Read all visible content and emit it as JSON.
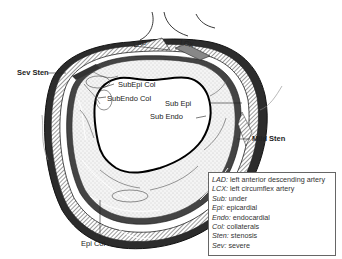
{
  "diagram": {
    "labels": {
      "lad": "LAD",
      "lcx": "LCX",
      "sev_sten": "Sev Sten",
      "subepi_col": "SubEpi Col",
      "subendo_col": "SubEndo Col",
      "sub_epi": "Sub Epi",
      "sub_endo": "Sub Endo",
      "mild_sten": "Mild Sten",
      "epi_col": "Epi Col"
    },
    "legend": [
      {
        "abbr": "LAD:",
        "text": " left anterior descending artery"
      },
      {
        "abbr": "LCX:",
        "text": " left circumflex artery"
      },
      {
        "abbr": "Sub:",
        "text": " under"
      },
      {
        "abbr": "Epi:",
        "text": " epicardial"
      },
      {
        "abbr": "Endo:",
        "text": " endocardial"
      },
      {
        "abbr": "Col:",
        "text": " collaterals"
      },
      {
        "abbr": "Sten:",
        "text": " stenosis"
      },
      {
        "abbr": "Sev:",
        "text": " severe"
      }
    ],
    "colors": {
      "line": "#111111",
      "wall_dark": "#2a2a2a",
      "hatch": "#888888",
      "myocardium_stipple": "#d8d8d8",
      "background": "#ffffff"
    }
  }
}
